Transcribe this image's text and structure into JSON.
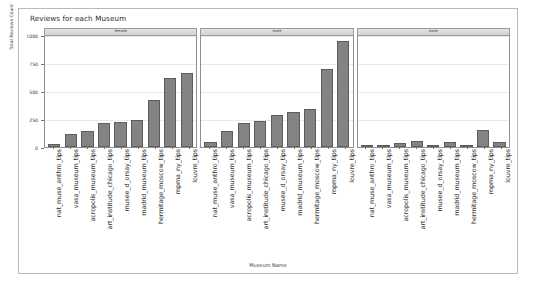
{
  "chart_data": {
    "type": "bar",
    "title": "Reviews for each Museum",
    "xlabel": "Museum Name",
    "ylabel": "Total Reviews Count",
    "ylim": [
      0,
      1000
    ],
    "yticks": [
      0,
      250,
      500,
      750,
      1000
    ],
    "ytick_labels": [
      "0",
      "250",
      "500",
      "750",
      "1000"
    ],
    "grid": true,
    "legend": "none",
    "facet_variable": "gender",
    "facets": [
      {
        "label": "female",
        "categories": [
          "nat_muse_anthro_tips",
          "vasa_museum_tips",
          "acropolis_museum_tips",
          "art_institude_chicago_tips",
          "musee_d_orsay_tips",
          "madrid_museum_tips",
          "hermitage_moscow_tips",
          "mpma_ny_tips",
          "louvre_tips"
        ],
        "values": [
          30,
          120,
          140,
          215,
          225,
          245,
          420,
          620,
          660
        ]
      },
      {
        "label": "male",
        "categories": [
          "nat_muse_anthro_tips",
          "vasa_museum_tips",
          "acropolis_museum_tips",
          "art_institude_chicago_tips",
          "musee_d_orsay_tips",
          "madrid_museum_tips",
          "hermitage_moscow_tips",
          "mpma_ny_tips",
          "louvre_tips"
        ],
        "values": [
          45,
          140,
          215,
          235,
          290,
          310,
          340,
          700,
          950
        ]
      },
      {
        "label": "none",
        "categories": [
          "nat_muse_anthro_tips",
          "vasa_museum_tips",
          "acropolis_museum_tips",
          "art_institude_chicago_tips",
          "musee_d_orsay_tips",
          "madrid_museum_tips",
          "hermitage_moscow_tips",
          "mpma_ny_tips",
          "louvre_tips"
        ],
        "values": [
          12,
          18,
          35,
          55,
          22,
          45,
          20,
          150,
          45
        ]
      }
    ],
    "bar_color": "#838383",
    "bar_border_color": "#5d5d5d",
    "strip_background": "#dcdcdc",
    "panel_border": "#8f8f8f",
    "grid_color": "#e9e9e9"
  }
}
